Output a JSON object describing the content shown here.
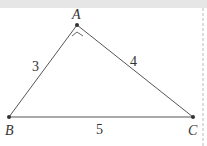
{
  "diagram": {
    "vertices": {
      "A": {
        "label": "A",
        "x": 77,
        "y": 25
      },
      "B": {
        "label": "B",
        "x": 9,
        "y": 117
      },
      "C": {
        "label": "C",
        "x": 193,
        "y": 117
      }
    },
    "sides": {
      "AB": {
        "label": "3"
      },
      "AC": {
        "label": "4"
      },
      "BC": {
        "label": "5"
      }
    },
    "right_angle_at": "A",
    "colors": {
      "line": "#555555",
      "point": "#333333",
      "top_band": "#e6e6e6",
      "dashed_border": "#bbbbbb"
    }
  }
}
